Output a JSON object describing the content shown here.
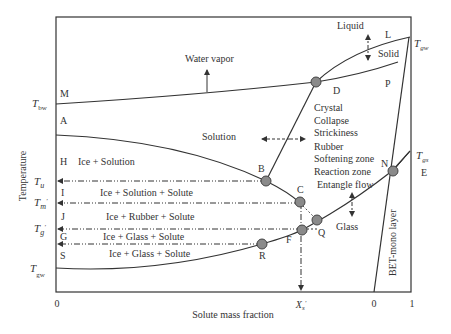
{
  "diagram": {
    "xlabel": "Solute mass fraction",
    "ylabel": "Temperature",
    "x_ticks": {
      "left_zero": "0",
      "xs": "X_s'",
      "bet_zero": "0",
      "one": "1"
    },
    "left_temps": {
      "tbw": "T_bw",
      "tu": "T_u",
      "tm": "T_m'",
      "tg": "T_g'",
      "tgw_bottom": "T_gw"
    },
    "right_temps": {
      "tgw_top": "T_gw",
      "tgs": "T_gs"
    },
    "point_letters": {
      "M": "M",
      "A": "A",
      "H": "H",
      "I": "I",
      "J": "J",
      "G": "G",
      "S": "S",
      "B": "B",
      "C": "C",
      "D": "D",
      "F": "F",
      "Q": "Q",
      "R": "R",
      "N": "N",
      "L": "L",
      "P": "P",
      "E": "E"
    },
    "regions": {
      "water_vapor": "Water vapor",
      "liquid": "Liquid",
      "solid": "Solid",
      "solution": "Solution",
      "ice_solution": "Ice + Solution",
      "ice_solution_solute": "Ice + Solution + Solute",
      "ice_rubber_solute": "Ice + Rubber + Solute",
      "ice_glass_solute_1": "Ice + Glass + Solute",
      "ice_glass_solute_2": "Ice + Glass + Solute",
      "glass": "Glass",
      "bet_mono_layer": "BET-mono layer"
    },
    "zone_list": [
      "Crystal",
      "Collapse",
      "Strickiness",
      "Rubber",
      "Softening zone",
      "Reaction zone",
      "Entangle flow"
    ],
    "colors": {
      "line": "#333333",
      "point_fill": "#8a8a8a",
      "point_stroke": "#444444",
      "text": "#333333"
    }
  }
}
